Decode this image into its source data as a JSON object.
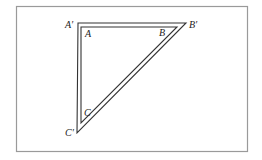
{
  "diagram": {
    "type": "geometric-figure",
    "labels": {
      "outer_A": "A′",
      "outer_B": "B′",
      "outer_C": "C′",
      "inner_A": "A",
      "inner_B": "B",
      "inner_C": "C"
    },
    "colors": {
      "frame": "#9a9a9a",
      "lines": "#333333",
      "background": "#ffffff"
    }
  }
}
